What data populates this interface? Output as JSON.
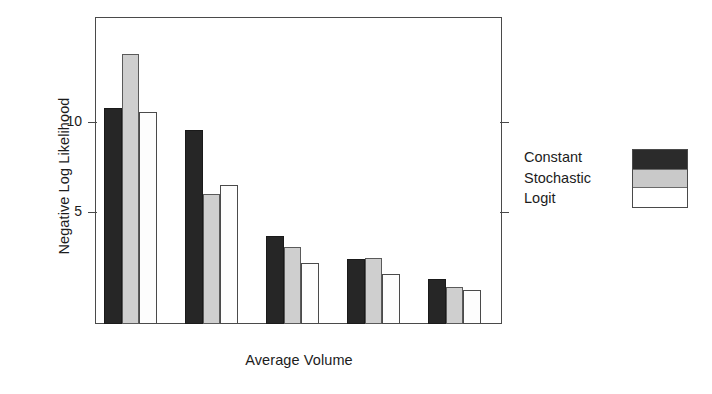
{
  "chart_data": {
    "type": "bar",
    "title": "",
    "subtitle": "",
    "xlabel": "Average Volume",
    "ylabel": "Negative Log Likelihood",
    "categories": [
      "1",
      "2",
      "3",
      "4",
      "5"
    ],
    "series": [
      {
        "name": "Constant",
        "color": "#262626",
        "values": [
          10.8,
          9.6,
          3.7,
          2.4,
          1.3
        ]
      },
      {
        "name": "Stochastic",
        "color": "#cfcfcf",
        "values": [
          13.8,
          6.0,
          3.1,
          2.45,
          0.85
        ]
      },
      {
        "name": "Logit",
        "color": "#fdfdfd",
        "values": [
          10.6,
          6.5,
          2.2,
          1.6,
          0.7
        ]
      }
    ],
    "ytick_labels": [
      "10",
      "5"
    ],
    "ytick_values": [
      10,
      5
    ],
    "ylim": [
      -1.2,
      15.8
    ],
    "grid": false,
    "legend_position": "right",
    "legend_entries": [
      "Constant",
      "Stochastic",
      "Logit"
    ],
    "axis_color": "#4a4a4a",
    "frame": true
  },
  "axes": {
    "y_title": "Negative Log Likelihood",
    "x_title": "Average Volume",
    "ticks": [
      {
        "label": "10",
        "value": 10
      },
      {
        "label": "5",
        "value": 5
      }
    ]
  },
  "legend": {
    "items": [
      {
        "label": "Constant",
        "swatch": "black-swatch"
      },
      {
        "label": "Stochastic",
        "swatch": "gray-swatch"
      },
      {
        "label": "Logit",
        "swatch": "white-swatch"
      }
    ]
  }
}
